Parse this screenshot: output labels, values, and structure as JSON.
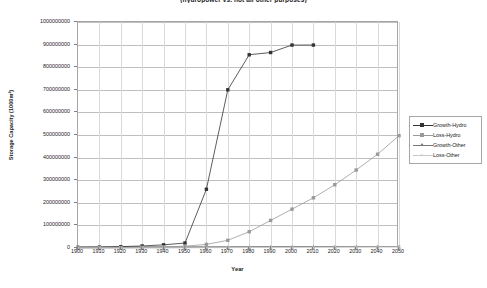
{
  "chart_data": {
    "type": "line",
    "title": "(hydropower vs. not all other purposes)",
    "xlabel": "Year",
    "ylabel": "Storage Capacity (1000m³)",
    "xlim": [
      1900,
      2050
    ],
    "ylim": [
      0,
      1000000000
    ],
    "xticks": [
      1900,
      1910,
      1920,
      1930,
      1940,
      1950,
      1960,
      1970,
      1980,
      1990,
      2000,
      2010,
      2020,
      2030,
      2040,
      2050
    ],
    "yticks": [
      0,
      100000000,
      200000000,
      300000000,
      400000000,
      500000000,
      600000000,
      700000000,
      800000000,
      900000000,
      1000000000
    ],
    "ytick_labels": [
      "0",
      "100000000",
      "200000000",
      "300000000",
      "400000000",
      "500000000",
      "600000000",
      "700000000",
      "800000000",
      "900000000",
      "1000000000"
    ],
    "xtick_labels": [
      "1900",
      "1910",
      "1920",
      "1930",
      "1940",
      "1950",
      "1960",
      "1970",
      "1980",
      "1990",
      "2000",
      "2010",
      "2020",
      "2030",
      "2040",
      "2050"
    ],
    "grid": "horizontal",
    "legend_position": "right",
    "series": [
      {
        "name": "Growth-Hydro",
        "color": "#333333",
        "marker": "square-filled",
        "x": [
          1900,
          1910,
          1920,
          1930,
          1940,
          1950,
          1960,
          1970,
          1980,
          1990,
          2000,
          2010
        ],
        "values": [
          3000000,
          4000000,
          6000000,
          9000000,
          14000000,
          22000000,
          260000000,
          700000000,
          855000000,
          865000000,
          898000000,
          898000000
        ]
      },
      {
        "name": "Loss-Hydro",
        "color": "#9a9a9a",
        "marker": "square-filled",
        "x": [
          1900,
          1910,
          1920,
          1930,
          1940,
          1950,
          1960,
          1970,
          1980,
          1990,
          2000,
          2010,
          2020,
          2030,
          2040,
          2050
        ],
        "values": [
          1000000,
          1500000,
          2000000,
          3000000,
          5000000,
          8000000,
          16000000,
          34000000,
          72000000,
          122000000,
          172000000,
          222000000,
          280000000,
          345000000,
          415000000,
          497000000
        ]
      },
      {
        "name": "Growth-Other",
        "color": "#777777",
        "marker": "triangle",
        "x": [
          1900,
          1910,
          1920,
          1930,
          1940,
          1950,
          1960,
          1970,
          1980,
          1990,
          2000,
          2010,
          2020,
          2030,
          2040,
          2050
        ],
        "values": [
          500000,
          700000,
          900000,
          1200000,
          1600000,
          2100000,
          2800000,
          3600000,
          4400000,
          5000000,
          5400000,
          5600000,
          5700000,
          5800000,
          5900000,
          6000000
        ]
      },
      {
        "name": "Loss-Other",
        "color": "#c8c8c8",
        "marker": "x",
        "x": [
          1900,
          1910,
          1920,
          1930,
          1940,
          1950,
          1960,
          1970,
          1980,
          1990,
          2000,
          2010,
          2020,
          2030,
          2040,
          2050
        ],
        "values": [
          200000,
          300000,
          400000,
          500000,
          700000,
          900000,
          1200000,
          1500000,
          1900000,
          2300000,
          2700000,
          3100000,
          3500000,
          3900000,
          4300000,
          4700000
        ]
      }
    ]
  },
  "legend": {
    "items": [
      {
        "label": "Growth-Hydro"
      },
      {
        "label": "Loss-Hydro"
      },
      {
        "label": "Growth-Other"
      },
      {
        "label": "Loss-Other"
      }
    ]
  }
}
